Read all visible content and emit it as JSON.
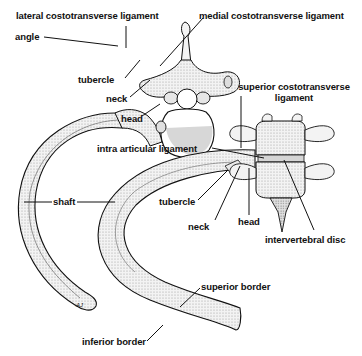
{
  "figure": {
    "views": [
      "superior view of rib with thoracic vertebra",
      "lateral view of rib articulating with vertebral column"
    ]
  },
  "labels": {
    "lateral_costotransverse_ligament": "lateral costotransverse ligament",
    "medial_costotransverse_ligament": "medial costotransverse ligament",
    "angle": "angle",
    "tubercle_top": "tubercle",
    "neck_top": "neck",
    "head_top": "head",
    "superior_costotransverse_ligament_line1": "superior costotransverse",
    "superior_costotransverse_ligament_line2": "ligament",
    "intra_articular_ligament": "intra articular ligament",
    "shaft": "shaft",
    "tubercle_bottom": "tubercle",
    "neck_bottom": "neck",
    "head_bottom": "head",
    "intervertebral_disc": "intervertebral disc",
    "superior_border": "superior border",
    "inferior_border": "inferior border"
  },
  "signature": "AJ",
  "colors": {
    "ink": "#111111",
    "bone_fill": "#f4f4f4",
    "shade": "#cfcfcf",
    "disc": "#d8d8d8",
    "background": "#ffffff"
  }
}
